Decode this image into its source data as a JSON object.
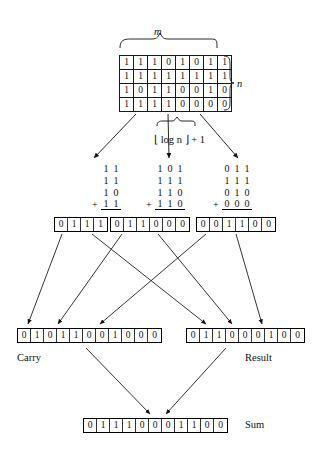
{
  "diagram": {
    "labels": {
      "m": "m",
      "n": "n",
      "formula": "⌊ log n ⌋ + 1",
      "carry": "Carry",
      "result": "Result",
      "sum": "Sum",
      "plus": "+"
    },
    "matrix": {
      "rows": [
        [
          "1",
          "1",
          "1",
          "0",
          "1",
          "0",
          "1",
          "1"
        ],
        [
          "1",
          "1",
          "1",
          "1",
          "1",
          "1",
          "1",
          "1"
        ],
        [
          "1",
          "0",
          "1",
          "1",
          "0",
          "0",
          "1",
          "0"
        ],
        [
          "1",
          "1",
          "1",
          "1",
          "0",
          "0",
          "0",
          "0"
        ]
      ],
      "columns": 8,
      "row_count": 4
    },
    "additions": [
      {
        "name": "left-group",
        "operands": [
          [
            "1",
            "1"
          ],
          [
            "1",
            "1"
          ],
          [
            "1",
            "0"
          ],
          [
            "1",
            "1"
          ]
        ],
        "plus_on_last": true,
        "sum": [
          "0",
          "1",
          "1",
          "1"
        ]
      },
      {
        "name": "middle-group",
        "operands": [
          [
            "1",
            "0",
            "1"
          ],
          [
            "1",
            "1",
            "1"
          ],
          [
            "1",
            "1",
            "0"
          ],
          [
            "1",
            "1",
            "0"
          ]
        ],
        "plus_on_last": true,
        "sum": [
          "0",
          "1",
          "1",
          "0",
          "0",
          "0"
        ]
      },
      {
        "name": "right-group",
        "operands": [
          [
            "0",
            "1",
            "1"
          ],
          [
            "1",
            "1",
            "1"
          ],
          [
            "0",
            "1",
            "0"
          ],
          [
            "0",
            "0",
            "0"
          ]
        ],
        "plus_on_last": true,
        "sum": [
          "0",
          "0",
          "1",
          "1",
          "0",
          "0"
        ]
      }
    ],
    "carry_row": [
      "0",
      "1",
      "0",
      "1",
      "1",
      "0",
      "0",
      "1",
      "0",
      "0",
      "0"
    ],
    "result_row": [
      "0",
      "1",
      "1",
      "0",
      "0",
      "0",
      "1",
      "0",
      "0"
    ],
    "sum_row": [
      "0",
      "1",
      "1",
      "1",
      "0",
      "0",
      "0",
      "1",
      "1",
      "0",
      "0"
    ]
  },
  "colors": {
    "ink": "#111111",
    "line": "#1a1a1a",
    "background": "#ffffff"
  }
}
